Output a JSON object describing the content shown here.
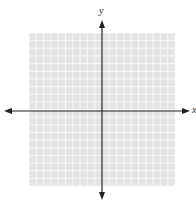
{
  "diagram": {
    "type": "coordinate-plane",
    "x_axis_label": "x",
    "y_axis_label": "y",
    "grid": {
      "columns": 20,
      "rows": 20,
      "left": 29,
      "top": 33,
      "right": 175,
      "bottom": 186,
      "fill_color": "#e4e4e4",
      "line_color": "#f7f7f7"
    },
    "origin": {
      "x": 102,
      "y": 111
    },
    "x_axis": {
      "from": 4,
      "to": 190,
      "color": "#222222"
    },
    "y_axis": {
      "from": 20,
      "to": 200,
      "color": "#222222"
    }
  }
}
